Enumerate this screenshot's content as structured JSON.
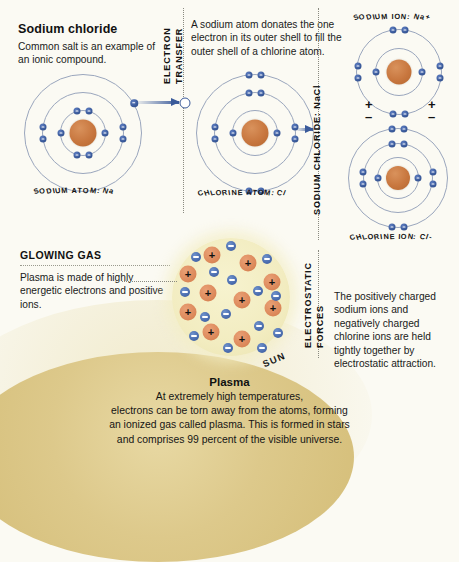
{
  "intro": {
    "title": "Sodium chloride",
    "body": "Common salt is an example of an ionic compound."
  },
  "electron_transfer": {
    "vertical_label_line1": "ELECTRON",
    "vertical_label_line2": "TRANSFER",
    "description": "A sodium atom donates the one electron in its outer shell to fill the outer shell of a chlorine atom."
  },
  "atoms": {
    "sodium": {
      "label": "SODIUM ATOM: Na"
    },
    "chlorine": {
      "label": "CHLORINE ATOM: Cl"
    }
  },
  "sodium_chloride": {
    "vertical_label": "SODIUM CHLORIDE: NaCl"
  },
  "ions": {
    "sodium": {
      "label": "SODIUM ION: Na+"
    },
    "chlorine": {
      "label": "CHLORINE ION: Cl-"
    },
    "charge_left": {
      "plus": "+",
      "minus": "–"
    },
    "charge_right": {
      "plus": "+",
      "minus": "–"
    }
  },
  "glowing_gas": {
    "title": "GLOWING GAS",
    "body": "Plasma is made of highly energetic electrons and positive ions."
  },
  "electrostatic": {
    "vertical_label_line1": "ELECTROSTATIC",
    "vertical_label_line2": "FORCES",
    "description": "The positively charged sodium ions and negatively charged chlorine ions are held tightly together by electrostatic attraction."
  },
  "sun": {
    "label": "SUN"
  },
  "plasma": {
    "title": "Plasma",
    "lines": [
      "At extremely high temperatures,",
      "electrons can be torn away from the atoms, forming",
      "an ionized gas called plasma. This is formed in stars",
      "and comprises 99 percent of the visible universe."
    ]
  },
  "symbols": {
    "plus": "+",
    "minus": "–"
  },
  "colors": {
    "background": "#fbfaf3",
    "nucleus": "#c8773f",
    "electron": "#3a5a9a",
    "shell": "#9aa6bd",
    "plasma_fill": "#f2ecc0",
    "plasma_positive": "#dd8a5c",
    "plasma_negative": "#4a6cae",
    "sun": "#d4bd77",
    "arrow": "#3a5a9a",
    "text": "#111111"
  },
  "diagram_data": {
    "type": "diagram",
    "sodium_atom": {
      "shells": [
        3
      ],
      "shell_radii": [
        19,
        37,
        55
      ],
      "electron_counts_by_shell": [
        2,
        8,
        1
      ],
      "nucleus_radius": 13
    },
    "chlorine_atom": {
      "shell_radii": [
        19,
        37,
        55
      ],
      "electron_counts_by_shell": [
        2,
        8,
        7
      ],
      "nucleus_radius": 13
    },
    "sodium_ion": {
      "shell_radii": [
        19,
        37
      ],
      "electron_counts_by_shell": [
        2,
        8
      ],
      "nucleus_radius": 12
    },
    "chlorine_ion": {
      "shell_radii": [
        17,
        33,
        49
      ],
      "electron_counts_by_shell": [
        2,
        8,
        8
      ],
      "nucleus_radius": 12
    },
    "plasma_positive_ion_count": 10,
    "plasma_negative_electron_count": 15
  }
}
